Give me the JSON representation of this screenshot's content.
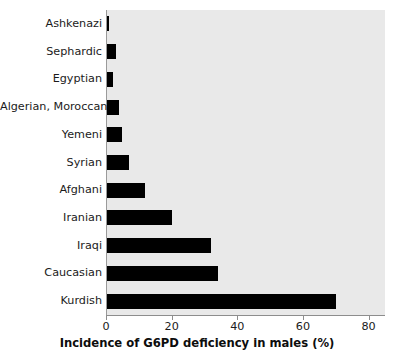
{
  "chart_data": {
    "type": "bar",
    "orientation": "horizontal",
    "title": "",
    "xlabel": "Incidence of G6PD deficiency in males (%)",
    "ylabel": "",
    "categories": [
      "Ashkenazi",
      "Sephardic",
      "Egyptian",
      "Algerian, Moroccan",
      "Yemeni",
      "Syrian",
      "Afghani",
      "Iranian",
      "Iraqi",
      "Caucasian",
      "Kurdish"
    ],
    "values": [
      1,
      3,
      2,
      4,
      5,
      7,
      12,
      20,
      32,
      34,
      70
    ],
    "xlim": [
      0,
      85
    ],
    "xticks": [
      0,
      20,
      40,
      60,
      80
    ],
    "xtick_labels": [
      "0",
      "20",
      "40",
      "60",
      "80"
    ],
    "grid": false,
    "legend": null,
    "bar_color": "#000000",
    "plot_background": "#e9e9e9",
    "figure_background": "#ffffff",
    "axis_color": "#8d8d8d"
  }
}
